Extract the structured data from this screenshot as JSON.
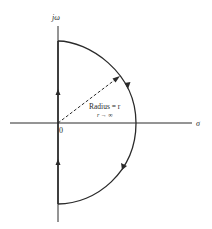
{
  "diagram": {
    "axes": {
      "vertical_label": "jω",
      "horizontal_label": "σ",
      "origin_label": "0"
    },
    "annotations": {
      "radius_label": "Radius = r",
      "limit_label": "r → ∞"
    },
    "contour": {
      "shape": "right half-plane semicircle closed along jω axis",
      "direction": "clockwise"
    },
    "colors": {
      "stroke": "#2a2a2a",
      "background": "#ffffff"
    }
  }
}
